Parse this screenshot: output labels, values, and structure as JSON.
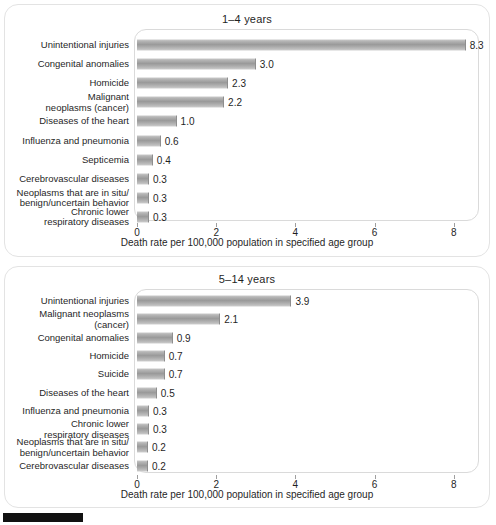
{
  "page": {
    "background_color": "#ffffff",
    "panel_border_color": "#e3e3e3",
    "bar_color": "#9a9a9a",
    "text_color": "#1f1f1f",
    "marker_color": "#111111"
  },
  "charts": [
    {
      "title": "1–4 years",
      "xlabel": "Death rate per 100,000 population in specified age group",
      "ticks": [
        "0",
        "2",
        "4",
        "6",
        "8"
      ],
      "rows": [
        {
          "label": "Unintentional injuries",
          "value": "8.3"
        },
        {
          "label": "Congenital anomalies",
          "value": "3.0"
        },
        {
          "label": "Homicide",
          "value": "2.3"
        },
        {
          "label": "Malignant\nneoplasms (cancer)",
          "value": "2.2"
        },
        {
          "label": "Diseases of the heart",
          "value": "1.0"
        },
        {
          "label": "Influenza and pneumonia",
          "value": "0.6"
        },
        {
          "label": "Septicemia",
          "value": "0.4"
        },
        {
          "label": "Cerebrovascular diseases",
          "value": "0.3"
        },
        {
          "label": "Neoplasms that are in situ/\nbenign/uncertain behavior",
          "value": "0.3"
        },
        {
          "label": "Chronic lower\nrespiratory diseases",
          "value": "0.3"
        }
      ]
    },
    {
      "title": "5–14 years",
      "xlabel": "Death rate per 100,000 population in specified age group",
      "ticks": [
        "0",
        "2",
        "4",
        "6",
        "8"
      ],
      "rows": [
        {
          "label": "Unintentional injuries",
          "value": "3.9"
        },
        {
          "label": "Malignant neoplasms\n(cancer)",
          "value": "2.1"
        },
        {
          "label": "Congenital anomalies",
          "value": "0.9"
        },
        {
          "label": "Homicide",
          "value": "0.7"
        },
        {
          "label": "Suicide",
          "value": "0.7"
        },
        {
          "label": "Diseases of the heart",
          "value": "0.5"
        },
        {
          "label": "Influenza and pneumonia",
          "value": "0.3"
        },
        {
          "label": "Chronic lower\nrespiratory diseases",
          "value": "0.3"
        },
        {
          "label": "Neoplasms that are in situ/\nbenign/uncertain behavior",
          "value": "0.2"
        },
        {
          "label": "Cerebrovascular diseases",
          "value": "0.2"
        }
      ]
    }
  ],
  "chart_data": [
    {
      "type": "bar",
      "orientation": "horizontal",
      "title": "1–4 years",
      "xlabel": "Death rate per 100,000 population in specified age group",
      "ylabel": "",
      "xlim": [
        0,
        8.8
      ],
      "xticks": [
        0,
        2,
        4,
        6,
        8
      ],
      "grid": false,
      "legend": "none",
      "categories": [
        "Unintentional injuries",
        "Congenital anomalies",
        "Homicide",
        "Malignant neoplasms (cancer)",
        "Diseases of the heart",
        "Influenza and pneumonia",
        "Septicemia",
        "Cerebrovascular diseases",
        "Neoplasms that are in situ/benign/uncertain behavior",
        "Chronic lower respiratory diseases"
      ],
      "values": [
        8.3,
        3.0,
        2.3,
        2.2,
        1.0,
        0.6,
        0.4,
        0.3,
        0.3,
        0.3
      ],
      "data_labels": [
        "8.3",
        "3.0",
        "2.3",
        "2.2",
        "1.0",
        "0.6",
        "0.4",
        "0.3",
        "0.3",
        "0.3"
      ]
    },
    {
      "type": "bar",
      "orientation": "horizontal",
      "title": "5–14 years",
      "xlabel": "Death rate per 100,000 population in specified age group",
      "ylabel": "",
      "xlim": [
        0,
        8.8
      ],
      "xticks": [
        0,
        2,
        4,
        6,
        8
      ],
      "grid": false,
      "legend": "none",
      "categories": [
        "Unintentional injuries",
        "Malignant neoplasms (cancer)",
        "Congenital anomalies",
        "Homicide",
        "Suicide",
        "Diseases of the heart",
        "Influenza and pneumonia",
        "Chronic lower respiratory diseases",
        "Neoplasms that are in situ/benign/uncertain behavior",
        "Cerebrovascular diseases"
      ],
      "values": [
        3.9,
        2.1,
        0.9,
        0.7,
        0.7,
        0.5,
        0.3,
        0.3,
        0.2,
        0.2
      ],
      "data_labels": [
        "3.9",
        "2.1",
        "0.9",
        "0.7",
        "0.7",
        "0.5",
        "0.3",
        "0.3",
        "0.2",
        "0.2"
      ]
    }
  ]
}
